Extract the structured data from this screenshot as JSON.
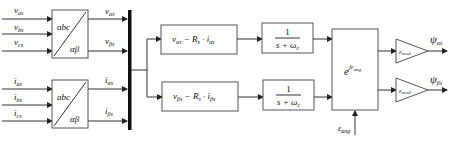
{
  "diagram": {
    "inputs_voltage": [
      {
        "sym": "v",
        "sub": "as"
      },
      {
        "sym": "v",
        "sub": "bs"
      },
      {
        "sym": "v",
        "sub": "cs"
      }
    ],
    "inputs_current": [
      {
        "sym": "i",
        "sub": "as"
      },
      {
        "sym": "i",
        "sub": "bs"
      },
      {
        "sym": "i",
        "sub": "cs"
      }
    ],
    "transform_blocks": [
      {
        "top": "abc",
        "bottom": "αβ"
      },
      {
        "top": "abc",
        "bottom": "αβ"
      }
    ],
    "transform_outputs": [
      {
        "sym": "v",
        "sub": "αs"
      },
      {
        "sym": "v",
        "sub": "βs"
      },
      {
        "sym": "i",
        "sub": "αs"
      },
      {
        "sym": "i",
        "sub": "βs"
      }
    ],
    "emf_blocks": [
      {
        "v": "v",
        "v_sub": "αs",
        "minus": " − R",
        "r_sub": "s",
        "dot": " · i",
        "i_sub": "αs"
      },
      {
        "v": "v",
        "v_sub": "βs",
        "minus": " − R",
        "r_sub": "s",
        "dot": " · i",
        "i_sub": "βs"
      }
    ],
    "filter_blocks": [
      {
        "num": "1",
        "den": "s + ω",
        "den_sub": "c"
      },
      {
        "num": "1",
        "den": "s + ω",
        "den_sub": "c"
      }
    ],
    "rotation_block": {
      "base": "e",
      "exp": "jε",
      "exp_sub": "ang"
    },
    "angle_input": {
      "sym": "ε",
      "sub": "ang"
    },
    "gain_blocks": [
      {
        "sym": "ε",
        "sub": "mod"
      },
      {
        "sym": "ε",
        "sub": "mod"
      }
    ],
    "outputs": [
      {
        "sym": "ψ",
        "sub": "αs"
      },
      {
        "sym": "ψ",
        "sub": "βs"
      }
    ]
  }
}
